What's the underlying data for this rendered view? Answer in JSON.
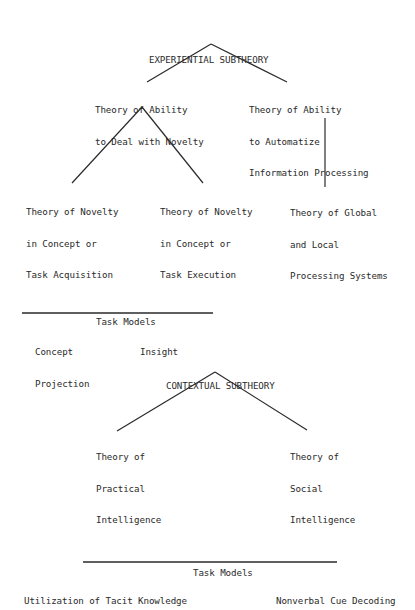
{
  "experiential": {
    "title": "EXPERIENTIAL SUBTHEORY",
    "novelty": {
      "lines": [
        "Theory of Ability",
        "to Deal with Novelty"
      ]
    },
    "automatize": {
      "lines": [
        "Theory of Ability",
        "to Automatize",
        "Information Processing"
      ]
    },
    "acquisition": {
      "lines": [
        "Theory of Novelty",
        "in Concept or",
        "Task Acquisition"
      ]
    },
    "execution": {
      "lines": [
        "Theory of Novelty",
        "in Concept or",
        "Task Execution"
      ]
    },
    "global_local": {
      "lines": [
        "Theory of Global",
        "and Local",
        "Processing Systems"
      ]
    },
    "task_models": {
      "heading": "Task Models",
      "items": [
        {
          "lines": [
            "Concept",
            "Projection"
          ]
        },
        {
          "lines": [
            "Insight"
          ]
        }
      ]
    }
  },
  "contextual": {
    "title": "CONTEXTUAL SUBTHEORY",
    "practical": {
      "lines": [
        "Theory of",
        "Practical",
        "Intelligence"
      ]
    },
    "social": {
      "lines": [
        "Theory of",
        "Social",
        "Intelligence"
      ]
    },
    "task_models": {
      "heading": "Task Models",
      "items": [
        {
          "lines": [
            "Utilization of Tacit Knowledge"
          ]
        },
        {
          "lines": [
            "Nonverbal Cue Decoding"
          ]
        }
      ]
    }
  }
}
